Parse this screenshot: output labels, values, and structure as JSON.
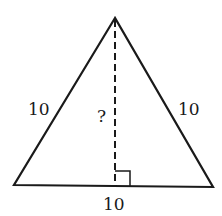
{
  "diagram": {
    "type": "isosceles-triangle-altitude",
    "side_labels": {
      "left": "10",
      "right": "10",
      "base": "10"
    },
    "altitude_label": "?",
    "right_angle_marker": true,
    "colors": {
      "stroke": "#1a1a1a",
      "background": "#ffffff"
    }
  }
}
